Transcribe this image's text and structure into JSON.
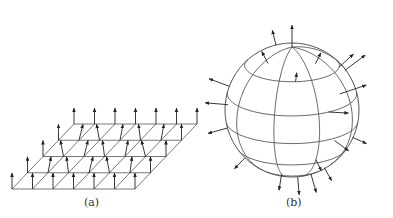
{
  "figure": {
    "panels": [
      {
        "id": "a",
        "label": "(a)",
        "description": "Square lattice in perspective with vector arrows at each site"
      },
      {
        "id": "b",
        "label": "(b)",
        "description": "Sphere with latitude/longitude grid and outward-pointing arrows"
      }
    ],
    "colors": {
      "line": "#555555",
      "arrow": "#222222",
      "background": "#ffffff"
    }
  },
  "lattice": {
    "columns": 7,
    "rows": 5,
    "front_left": [
      12,
      189
    ],
    "col_step": [
      20.5,
      0
    ],
    "row_step": [
      15.5,
      -16.25
    ],
    "arrow_len": 16
  },
  "sphere": {
    "center": [
      292,
      110
    ],
    "radius": 67
  }
}
